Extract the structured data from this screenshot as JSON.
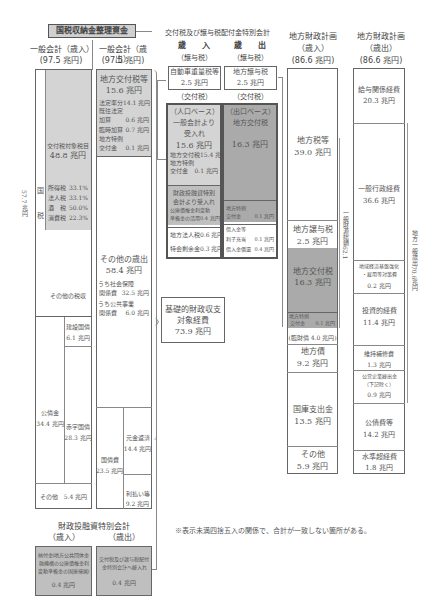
{
  "title": "国税収納金整理資金",
  "general_revenue": {
    "header": "一般会計（歳入）",
    "total": "(97.5 兆円)",
    "kokuzei_label_side": "57.7 兆円",
    "kokuzei_char1": "国",
    "kokuzei_char2": "税",
    "kofu_target": {
      "label": "交付税対象税目",
      "value": "48.8 兆円"
    },
    "taxes": [
      {
        "name": "所得税",
        "rate": "33.1%"
      },
      {
        "name": "法人税",
        "rate": "33.1%"
      },
      {
        "name": "酒　税",
        "rate": "50.0%"
      },
      {
        "name": "消費税",
        "rate": "22.3%"
      }
    ],
    "other_tax": "その他の税収",
    "bonds": {
      "label": "公債金",
      "value": "34.4 兆円"
    },
    "construction_bonds": {
      "label": "建設国債",
      "value": "6.1 兆円"
    },
    "deficit_bonds": {
      "label": "赤字国債",
      "value": "28.3 兆円"
    },
    "other": "その他　5.4 兆円"
  },
  "general_expenditure": {
    "header": "一般会計（歳出）",
    "total": "(97.5 兆円)",
    "kofu": {
      "label": "地方交付税等",
      "value": "15.6 兆円"
    },
    "kofu_items": [
      {
        "name": "法定率分",
        "value": "14.1 兆円"
      },
      {
        "name": "既往法定",
        "value": ""
      },
      {
        "name": "加算",
        "value": "0.6 兆円"
      },
      {
        "name": "臨時加算",
        "value": "0.7 兆円"
      },
      {
        "name": "地方特例",
        "value": ""
      },
      {
        "name": "交付金",
        "value": "0.1 兆円"
      }
    ],
    "other_exp": {
      "label": "その他の歳出",
      "value": "58.4 兆円"
    },
    "social": {
      "label": "うち社会保障",
      "sub": "関係費",
      "value": "32.5 兆円"
    },
    "public_works": {
      "label": "うち公共事業",
      "sub": "関係費",
      "value": "6.0 兆円"
    },
    "debt": {
      "label": "国債費",
      "value": "23.5 兆円"
    },
    "principal": {
      "label": "元金返済",
      "value": "14.4 兆円"
    },
    "interest": {
      "label": "利払い等",
      "value": "9.2 兆円"
    }
  },
  "fiscal_investment": {
    "header": "財政投融資特別会計",
    "rev_label": "（歳入）",
    "exp_label": "（歳出）",
    "rev_box": {
      "line1": "納付金(地方公共団体金",
      "line2": "融機構の公庫債権金利",
      "line3": "変動準備金の国庫帰属)",
      "value": "0.4 兆円"
    },
    "exp_box": {
      "line1": "交付税及び譲与税配付",
      "line2": "金特別会計へ繰入れ",
      "value": "0.4 兆円"
    }
  },
  "special_account": {
    "header": "交付税及び譲与税配付金特別会計",
    "rev_title": "歳　　入",
    "exp_title": "歳　　出",
    "jouyo": "（譲与税）",
    "kofuzei": "（交付税）",
    "rev_jouyo": {
      "label": "自動車重量税等",
      "value": "2.5 兆円"
    },
    "exp_jouyo": {
      "label": "地方譲与税",
      "value": "2.5 兆円"
    },
    "rev_kofu": {
      "line1": "（人口ベース）",
      "line2": "一般会計より",
      "line3": "受入れ",
      "value": "15.6 兆円",
      "items": [
        {
          "name": "地方交付税",
          "value": "15.4 兆円"
        },
        {
          "name": "地方特例",
          "value": ""
        },
        {
          "name": "交付金",
          "value": "0.1 兆円"
        }
      ]
    },
    "rev_zaito": {
      "line1": "財政投融資特別",
      "line2": "会計より受入れ",
      "item1": "公庫債権金利変動",
      "item2": "準備金の活用",
      "value": "0.4 兆円"
    },
    "rev_others": [
      {
        "name": "地方法人税",
        "value": "0.6 兆円"
      },
      {
        "name": "特会剰余金",
        "value": "0.3 兆円"
      }
    ],
    "exp_kofu": {
      "line1": "（出口ベース）",
      "line2": "地方交付税",
      "value": "16.3 兆円"
    },
    "exp_tokurei": {
      "name1": "地方特例",
      "name2": "交付金",
      "value": "0.1 兆円"
    },
    "exp_others": [
      {
        "name": "借入金等",
        "value": ""
      },
      {
        "name": "利子充当",
        "value": "0.1 兆円"
      },
      {
        "name": "借入金償還",
        "value": "0.4 兆円"
      }
    ]
  },
  "basic_balance": {
    "line1": "基礎的財政収支",
    "line2": "対象経費",
    "value": "73.9 兆円"
  },
  "local_revenue": {
    "header": "地方財政計画",
    "sub": "（歳入）",
    "total": "(86.6 兆円)",
    "local_tax": {
      "label": "地方税等",
      "value": "39.0 兆円"
    },
    "jouyo": {
      "label": "地方譲与税",
      "value": "2.5 兆円"
    },
    "kofu": {
      "label": "地方交付税",
      "value": "16.3 兆円"
    },
    "tokurei": {
      "name1": "地方特例",
      "name2": "交付金",
      "value": "0.1 兆円"
    },
    "rinzai": "(臨財債 4.0 兆円)",
    "local_bonds": {
      "label": "地方債",
      "value": "9.2 兆円"
    },
    "treasury": {
      "label": "国庫支出金",
      "value": "13.5 兆円"
    },
    "other": {
      "label": "その他",
      "value": "5.9 兆円"
    },
    "general_fund_side": "一般財源総額62.1"
  },
  "local_expenditure": {
    "header": "地方財政計画",
    "sub": "（歳出）",
    "total": "(86.6 兆円)",
    "salary": {
      "label": "給与関係経費",
      "value": "20.3 兆円"
    },
    "admin": {
      "label": "一般行政経費",
      "value": "36.6 兆円"
    },
    "regional": {
      "line1": "地域経済基盤強化",
      "line2": "・雇用等対策費",
      "value": "0.2 兆円"
    },
    "investment": {
      "label": "投資的経費",
      "value": "11.4 兆円"
    },
    "maintenance": {
      "label": "維持補修費",
      "value": "1.3 兆円"
    },
    "enterprise": {
      "line1": "公営企業繰出金",
      "line2": "（下記除く）",
      "value": "0.9 兆円"
    },
    "bond_cost": {
      "label": "公債費等",
      "value": "14.2 兆円"
    },
    "water": {
      "label": "水準超経費",
      "value": "1.8 兆円"
    },
    "general_side": "地方一般歳出70.6兆円"
  },
  "footnote": "※表示未満四捨五入の関係で、合計が一致しない箇所がある。"
}
